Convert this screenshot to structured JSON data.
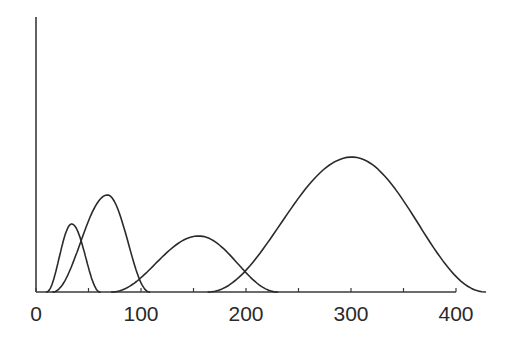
{
  "chart_data": {
    "type": "line",
    "title": "",
    "xlabel": "",
    "ylabel": "",
    "xlim": [
      0,
      400
    ],
    "x_ticks": [
      0,
      50,
      100,
      150,
      200,
      250,
      300,
      350,
      400
    ],
    "x_tick_labels": [
      "0",
      "",
      "100",
      "",
      "200",
      "",
      "300",
      "",
      "400"
    ],
    "y_ticks": [],
    "grid": false,
    "legend": null,
    "series": [
      {
        "name": "peak-1",
        "start": 10,
        "peak_x": 34,
        "end": 61,
        "peak_height": 68
      },
      {
        "name": "peak-2",
        "start": 16,
        "peak_x": 68,
        "end": 108,
        "peak_height": 97
      },
      {
        "name": "peak-3",
        "start": 72,
        "peak_x": 155,
        "end": 230,
        "peak_height": 56
      },
      {
        "name": "peak-4",
        "start": 164,
        "peak_x": 301,
        "end": 428,
        "peak_height": 135
      }
    ]
  },
  "layout": {
    "origin_px": [
      36,
      292
    ],
    "x_px_per_unit": 1.05,
    "y_axis_top_px": 17,
    "x_axis_end_px": 456
  }
}
